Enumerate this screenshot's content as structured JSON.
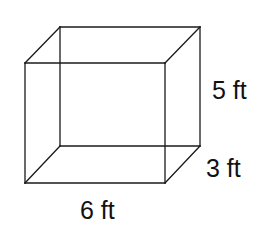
{
  "diagram": {
    "type": "rectangular-prism",
    "dimensions": {
      "length": {
        "value": 6,
        "unit": "ft",
        "label": "6 ft"
      },
      "height": {
        "value": 5,
        "unit": "ft",
        "label": "5 ft"
      },
      "depth": {
        "value": 3,
        "unit": "ft",
        "label": "3 ft"
      }
    },
    "line_color": "#1a1a1a",
    "text_color": "#111111",
    "background": "#ffffff"
  }
}
